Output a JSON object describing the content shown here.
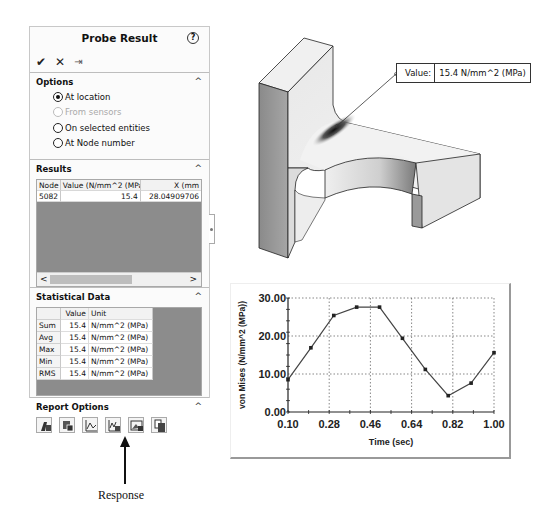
{
  "panel": {
    "title": "Probe Result",
    "help_icon": "help-icon",
    "toolbar": {
      "ok_icon": "✔",
      "cancel_icon": "✕",
      "pin_icon": "⇥"
    },
    "options": {
      "title": "Options",
      "items": [
        {
          "label": "At location",
          "checked": true,
          "disabled": false
        },
        {
          "label": "From sensors",
          "checked": false,
          "disabled": true
        },
        {
          "label": "On selected entities",
          "checked": false,
          "disabled": false
        },
        {
          "label": "At Node number",
          "checked": false,
          "disabled": false
        }
      ]
    },
    "results": {
      "title": "Results",
      "columns": [
        "Node",
        "Value (N/mm^2 (MPa))",
        "X (mm"
      ],
      "rows": [
        {
          "node": "5082",
          "value": "15.4",
          "x": "28.04909706"
        }
      ]
    },
    "statistics": {
      "title": "Statistical Data",
      "columns": [
        "",
        "Value",
        "Unit"
      ],
      "rows": [
        {
          "label": "Sum",
          "value": "15.4",
          "unit": "N/mm^2 (MPa)"
        },
        {
          "label": "Avg",
          "value": "15.4",
          "unit": "N/mm^2 (MPa)"
        },
        {
          "label": "Max",
          "value": "15.4",
          "unit": "N/mm^2 (MPa)"
        },
        {
          "label": "Min",
          "value": "15.4",
          "unit": "N/mm^2 (MPa)"
        },
        {
          "label": "RMS",
          "value": "15.4",
          "unit": "N/mm^2 (MPa)"
        }
      ]
    },
    "report_options": {
      "title": "Report Options",
      "buttons": [
        "save-to-file-icon",
        "save-as-sensor-icon",
        "plot-icon",
        "response-icon",
        "image-icon",
        "copy-icon"
      ]
    }
  },
  "annotation": {
    "label": "Response"
  },
  "model": {
    "value_tag": {
      "key": "Value:",
      "value": "15.4 N/mm^2 (MPa)"
    }
  },
  "chart_data": {
    "type": "line",
    "title": "",
    "xlabel": "Time (sec)",
    "ylabel": "von Mises (N/mm^2 (MPa))",
    "x": [
      0.1,
      0.2,
      0.3,
      0.4,
      0.5,
      0.6,
      0.7,
      0.8,
      0.9,
      1.0
    ],
    "series": [
      {
        "name": "von Mises",
        "values": [
          8.5,
          16.9,
          25.4,
          27.6,
          27.6,
          19.4,
          11.2,
          4.3,
          7.6,
          15.6
        ]
      }
    ],
    "xticks": [
      "0.10",
      "0.28",
      "0.46",
      "0.64",
      "0.82",
      "1.00"
    ],
    "yticks": [
      "0.00",
      "10.00",
      "20.00",
      "30.00"
    ],
    "xlim": [
      0.1,
      1.0
    ],
    "ylim": [
      0,
      30
    ],
    "grid": true,
    "legend": "none"
  }
}
